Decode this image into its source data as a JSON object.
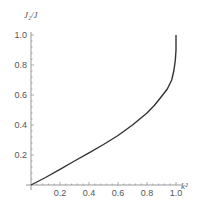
{
  "chart_data": {
    "type": "line",
    "title": "",
    "xlabel": "k²",
    "ylabel": "J₂/J",
    "xlim": [
      0,
      1.05
    ],
    "ylim": [
      0,
      1.0
    ],
    "grid": false,
    "legend": null,
    "x_ticks": [
      "0.2",
      "0.4",
      "0.6",
      "0.8",
      "1.0"
    ],
    "y_ticks": [
      "0.2",
      "0.4",
      "0.6",
      "0.8",
      "1.0"
    ],
    "series": [
      {
        "name": "J2/J vs k^2",
        "color": "#333333",
        "x": [
          0,
          0.1,
          0.2,
          0.3,
          0.4,
          0.5,
          0.6,
          0.7,
          0.8,
          0.85,
          0.9,
          0.94,
          0.97,
          0.985,
          0.995,
          1.0,
          1.0
        ],
        "y": [
          0,
          0.05,
          0.105,
          0.16,
          0.215,
          0.27,
          0.33,
          0.4,
          0.48,
          0.53,
          0.59,
          0.64,
          0.7,
          0.76,
          0.83,
          0.9,
          1.0
        ]
      }
    ]
  }
}
